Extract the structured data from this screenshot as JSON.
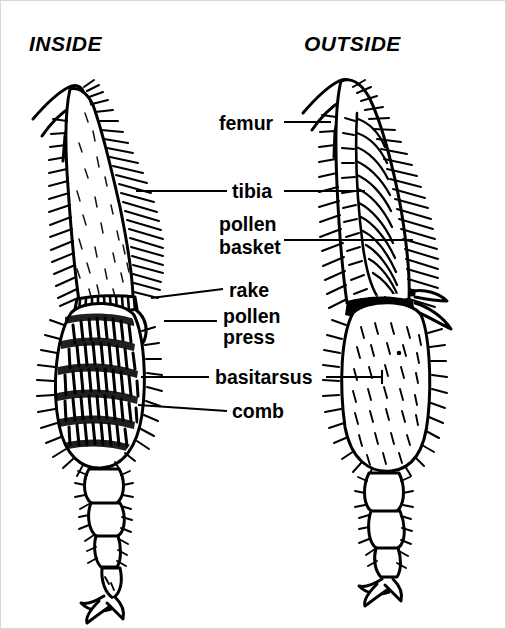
{
  "figure": {
    "background_color": "#ffffff",
    "ink_color": "#000000",
    "border_color": "#d8d8d8"
  },
  "headers": {
    "left": "INSIDE",
    "right": "OUTSIDE"
  },
  "labels": [
    {
      "id": "femur",
      "text": "femur",
      "x": 218,
      "y": 126
    },
    {
      "id": "tibia",
      "text": "tibia",
      "x": 231,
      "y": 196
    },
    {
      "id": "pollen",
      "text": "pollen",
      "x": 218,
      "y": 229
    },
    {
      "id": "basket",
      "text": "basket",
      "x": 218,
      "y": 252
    },
    {
      "id": "rake",
      "text": "rake",
      "x": 228,
      "y": 295
    },
    {
      "id": "pollen2",
      "text": "pollen",
      "x": 222,
      "y": 320
    },
    {
      "id": "press",
      "text": "press",
      "x": 222,
      "y": 341
    },
    {
      "id": "basitarsus",
      "text": "basitarsus",
      "x": 214,
      "y": 382
    },
    {
      "id": "comb",
      "text": "comb",
      "x": 231,
      "y": 415
    }
  ],
  "anatomy_parts": [
    "femur",
    "tibia",
    "pollen basket",
    "rake",
    "pollen press",
    "basitarsus",
    "comb"
  ],
  "views": [
    {
      "side": "inside",
      "shows": [
        "rake",
        "pollen press",
        "basitarsus",
        "comb",
        "tibia"
      ]
    },
    {
      "side": "outside",
      "shows": [
        "femur",
        "tibia",
        "pollen basket",
        "basitarsus"
      ]
    }
  ]
}
